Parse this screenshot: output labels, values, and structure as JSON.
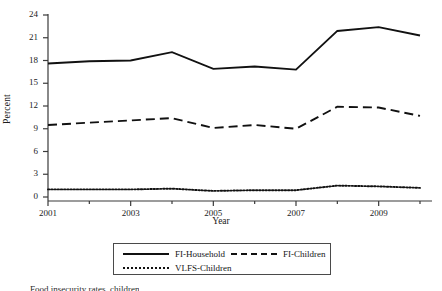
{
  "chart_data": {
    "type": "line",
    "title": "",
    "xlabel": "Year",
    "ylabel": "Percent",
    "x": [
      2001,
      2002,
      2003,
      2004,
      2005,
      2006,
      2007,
      2008,
      2009,
      2010
    ],
    "xlim": [
      2001,
      2010
    ],
    "ylim": [
      0,
      24
    ],
    "yticks": [
      0,
      3,
      6,
      9,
      12,
      15,
      18,
      21,
      24
    ],
    "xticks": [
      2001,
      2003,
      2005,
      2007,
      2009
    ],
    "xticks_minor": [
      2002,
      2004,
      2006,
      2008,
      2010
    ],
    "grid": false,
    "legend_position": "bottom",
    "series": [
      {
        "name": "FI-Household",
        "style": "solid",
        "values": [
          17.6,
          17.9,
          18.0,
          19.1,
          16.9,
          17.2,
          16.8,
          21.9,
          22.4,
          21.3
        ]
      },
      {
        "name": "FI-Children",
        "style": "dashed",
        "values": [
          9.5,
          9.8,
          10.1,
          10.4,
          9.1,
          9.5,
          9.0,
          11.9,
          11.8,
          10.7
        ]
      },
      {
        "name": "VLFS-Children",
        "style": "dotted",
        "values": [
          1.0,
          1.0,
          1.0,
          1.1,
          0.8,
          0.9,
          0.9,
          1.5,
          1.4,
          1.2
        ]
      }
    ]
  },
  "axes": {
    "ytick_labels": [
      "24",
      "21",
      "18",
      "15",
      "12",
      "9",
      "6",
      "3",
      "0"
    ],
    "xtick_labels": [
      "2001",
      "2003",
      "2005",
      "2007",
      "2009"
    ],
    "ylabel_text": "Percent",
    "xlabel_text": "Year"
  },
  "legend": {
    "entries": [
      {
        "label": "FI-Household",
        "style": "solid"
      },
      {
        "label": "FI-Children",
        "style": "dashed"
      },
      {
        "label": "VLFS-Children",
        "style": "dotted"
      }
    ]
  },
  "caption": {
    "text": "Food insecurity rates, children"
  }
}
